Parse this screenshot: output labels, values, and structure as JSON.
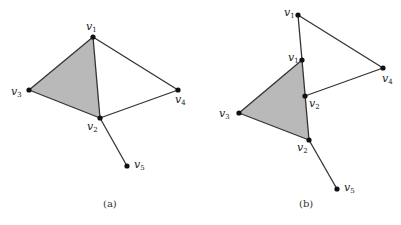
{
  "figure": {
    "panels": [
      {
        "id": "a",
        "caption": "(a)",
        "vertices": [
          {
            "name": "v",
            "sub": "1",
            "x": 93,
            "y": 37,
            "lx": 86,
            "ly": 28
          },
          {
            "name": "v",
            "sub": "3",
            "x": 29,
            "y": 90,
            "lx": 11,
            "ly": 95
          },
          {
            "name": "v",
            "sub": "2",
            "x": 100,
            "y": 118,
            "lx": 87,
            "ly": 131
          },
          {
            "name": "v",
            "sub": "4",
            "x": 178,
            "y": 90,
            "lx": 175,
            "ly": 104
          },
          {
            "name": "v",
            "sub": "5",
            "x": 127,
            "y": 166,
            "lx": 134,
            "ly": 169
          }
        ],
        "edges": [
          [
            "v1",
            "v2"
          ],
          [
            "v1",
            "v3"
          ],
          [
            "v3",
            "v2"
          ],
          [
            "v1",
            "v4"
          ],
          [
            "v4",
            "v2"
          ],
          [
            "v2",
            "v5"
          ]
        ],
        "shaded_face": [
          "v1",
          "v3",
          "v2"
        ]
      },
      {
        "id": "b",
        "caption": "(b)",
        "vertices": [
          {
            "name": "v",
            "sub": "1",
            "x": 298,
            "y": 15,
            "lx": 284,
            "ly": 15
          },
          {
            "name": "v",
            "sub": "1",
            "x": 302,
            "y": 60,
            "lx": 288,
            "ly": 60
          },
          {
            "name": "v",
            "sub": "4",
            "x": 383,
            "y": 68,
            "lx": 382,
            "ly": 83
          },
          {
            "name": "v",
            "sub": "2",
            "x": 305,
            "y": 96,
            "lx": 309,
            "ly": 109
          },
          {
            "name": "v",
            "sub": "3",
            "x": 239,
            "y": 113,
            "lx": 219,
            "ly": 118
          },
          {
            "name": "v",
            "sub": "2",
            "x": 309,
            "y": 140,
            "lx": 297,
            "ly": 152
          },
          {
            "name": "v",
            "sub": "5",
            "x": 337,
            "y": 189,
            "lx": 344,
            "ly": 192
          }
        ],
        "shaded_face": [
          "v1_mid",
          "v3",
          "v2_bottom"
        ]
      }
    ]
  }
}
